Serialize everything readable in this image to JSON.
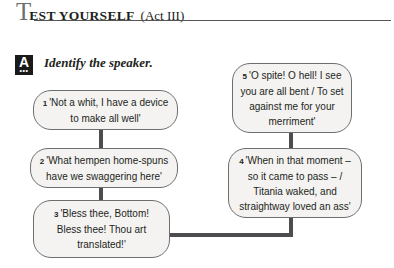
{
  "header": {
    "title_initial": "T",
    "title_rest": "EST YOURSELF",
    "title_paren": "(Act III)"
  },
  "section": {
    "badge_letter": "A",
    "badge_dots": "•••",
    "instruction": "Identify the speaker."
  },
  "quotes": [
    {
      "num": "1",
      "text": "'Not a whit, I have a device to make all well'"
    },
    {
      "num": "2",
      "text": "'What hempen home-spuns have we swaggering here'"
    },
    {
      "num": "3",
      "text": "'Bless thee, Bottom! Bless thee! Thou art translated!'"
    },
    {
      "num": "4",
      "text": "'When in that moment – so it came to pass – / Titania waked, and straightway loved an ass'"
    },
    {
      "num": "5",
      "text": "'O spite! O hell! I see you are all bent / To set against me for your merriment'"
    }
  ],
  "colors": {
    "box_fill": "#f4f3f2",
    "box_border": "#6d6e70",
    "connector": "#4d4d4f",
    "badge": "#1a1a1a"
  }
}
